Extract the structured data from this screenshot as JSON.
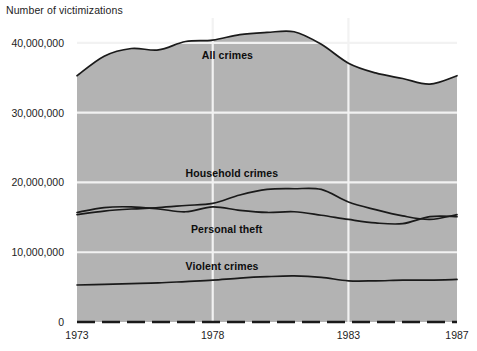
{
  "chart_data": {
    "type": "area",
    "title": "",
    "ylabel": "Number of victimizations",
    "xlabel": "",
    "ylim": [
      0,
      43000000
    ],
    "xlim": [
      1973,
      1987
    ],
    "grid": true,
    "legend_position": "inline-annotations",
    "ytick_labels": [
      "40,000,000",
      "30,000,000",
      "20,000,000",
      "10,000,000",
      "0"
    ],
    "ytick_values": [
      40000000,
      30000000,
      20000000,
      10000000,
      0
    ],
    "xtick_labels": [
      "1973",
      "1978",
      "1983",
      "1987"
    ],
    "xtick_values": [
      1973,
      1978,
      1983,
      1987
    ],
    "x": [
      1973,
      1974,
      1975,
      1976,
      1977,
      1978,
      1979,
      1980,
      1981,
      1982,
      1983,
      1984,
      1985,
      1986,
      1987
    ],
    "series": [
      {
        "name": "All crimes",
        "label": "All crimes",
        "values": [
          35300000,
          38100000,
          39200000,
          39000000,
          40200000,
          40400000,
          41200000,
          41500000,
          41600000,
          39800000,
          37100000,
          35700000,
          34900000,
          34100000,
          35300000
        ]
      },
      {
        "name": "Household crimes",
        "label": "Household crimes",
        "values": [
          15400000,
          15900000,
          16200000,
          16400000,
          16700000,
          17000000,
          18200000,
          19000000,
          19100000,
          19000000,
          17200000,
          16100000,
          15200000,
          14700000,
          15400000
        ]
      },
      {
        "name": "Personal theft",
        "label": "Personal theft",
        "values": [
          15700000,
          16400000,
          16500000,
          16200000,
          15800000,
          16500000,
          16000000,
          15700000,
          15800000,
          15300000,
          14700000,
          14200000,
          14100000,
          15100000,
          15100000
        ]
      },
      {
        "name": "Violent crimes",
        "label": "Violent crimes",
        "values": [
          5300000,
          5400000,
          5500000,
          5600000,
          5800000,
          6000000,
          6300000,
          6500000,
          6600000,
          6400000,
          5900000,
          5900000,
          6000000,
          6000000,
          6100000
        ]
      }
    ],
    "colors": {
      "area_fill": "#b3b3b3",
      "line": "#1a1a1a",
      "gridline": "#f2f2f2",
      "background": "#ffffff",
      "text": "#1a1a1a"
    },
    "annotations": [
      {
        "text": "All crimes",
        "x": 1977.6,
        "y": 38300000
      },
      {
        "text": "Household crimes",
        "x": 1977.0,
        "y": 21300000
      },
      {
        "text": "Personal theft",
        "x": 1977.2,
        "y": 13300000
      },
      {
        "text": "Violent crimes",
        "x": 1977.0,
        "y": 8000000
      }
    ]
  }
}
